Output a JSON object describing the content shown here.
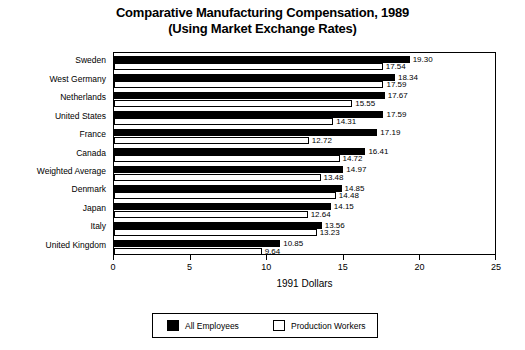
{
  "chart_data": {
    "type": "bar",
    "orientation": "horizontal",
    "title": "Comparative Manufacturing Compensation, 1989",
    "subtitle": "(Using Market Exchange Rates)",
    "xlabel": "1991 Dollars",
    "ylabel": "",
    "xlim": [
      0,
      25
    ],
    "xticks": [
      0,
      5,
      10,
      15,
      20,
      25
    ],
    "xticklabels": [
      "0",
      "5",
      "10",
      "15",
      "20",
      "25"
    ],
    "grid": false,
    "legend_position": "bottom",
    "categories": [
      "Sweden",
      "West Germany",
      "Netherlands",
      "United States",
      "France",
      "Canada",
      "Weighted Average",
      "Denmark",
      "Japan",
      "Italy",
      "United Kingdom"
    ],
    "series": [
      {
        "name": "All Employees",
        "color": "#000000",
        "values": [
          19.3,
          18.34,
          17.67,
          17.59,
          17.19,
          16.41,
          14.97,
          14.85,
          14.15,
          13.56,
          10.85
        ],
        "labels": [
          "19.30",
          "18.34",
          "17.67",
          "17.59",
          "17.19",
          "16.41",
          "14.97",
          "14.85",
          "14.15",
          "13.56",
          "10.85"
        ]
      },
      {
        "name": "Production Workers",
        "color": "#ffffff",
        "values": [
          17.54,
          17.59,
          15.55,
          14.31,
          12.72,
          14.72,
          13.48,
          14.48,
          12.64,
          13.23,
          9.64
        ],
        "labels": [
          "17.54",
          "17.59",
          "15.55",
          "14.31",
          "12.72",
          "14.72",
          "13.48",
          "14.48",
          "12.64",
          "13.23",
          "9.64"
        ]
      }
    ]
  },
  "legend": {
    "items": [
      {
        "label": "All Employees",
        "swatch": "black"
      },
      {
        "label": "Production Workers",
        "swatch": "white"
      }
    ]
  }
}
